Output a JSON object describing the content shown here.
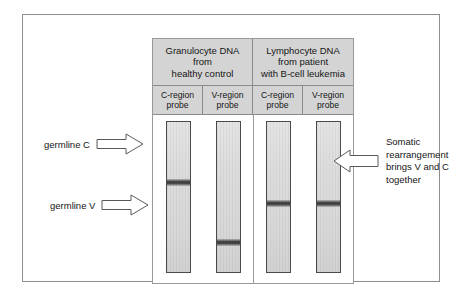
{
  "figure": {
    "panel": {
      "sample_headers": [
        {
          "id": "granulocyte",
          "lines": [
            "Granulocyte DNA",
            "from",
            "healthy control"
          ]
        },
        {
          "id": "lymphocyte",
          "lines": [
            "Lymphocyte DNA",
            "from patient",
            "with B-cell leukemia"
          ]
        }
      ],
      "probe_headers": [
        {
          "id": "probe-1",
          "lines": [
            "C-region",
            "probe"
          ]
        },
        {
          "id": "probe-2",
          "lines": [
            "V-region",
            "probe"
          ]
        },
        {
          "id": "probe-3",
          "lines": [
            "C-region",
            "probe"
          ]
        },
        {
          "id": "probe-4",
          "lines": [
            "V-region",
            "probe"
          ]
        }
      ],
      "lanes": [
        {
          "id": "lane-1-granulocyte-c-probe",
          "band_top_pct": 38
        },
        {
          "id": "lane-2-granulocyte-v-probe",
          "band_top_pct": 78
        },
        {
          "id": "lane-3-lymphocyte-c-probe",
          "band_top_pct": 52
        },
        {
          "id": "lane-4-lymphocyte-v-probe",
          "band_top_pct": 52
        }
      ]
    },
    "left_annotations": [
      {
        "id": "germline-c",
        "text": "germline C",
        "arrow": "arrow-right"
      },
      {
        "id": "germline-v",
        "text": "germline V",
        "arrow": "arrow-right"
      }
    ],
    "right_annotation": {
      "id": "somatic-rearrangement",
      "arrow": "arrow-left",
      "lines": [
        "Somatic",
        "rearrangement",
        "brings V and C",
        "together"
      ]
    }
  },
  "colors": {
    "frame_border": "#8f8f8f",
    "header_fill": "#d4d4d4",
    "header_border": "#8b8b8b",
    "lane_fill": "#dcdcdc",
    "lane_border": "#4a4a4a",
    "band": "#3a3a3a",
    "text": "#151515",
    "background": "#ffffff"
  }
}
